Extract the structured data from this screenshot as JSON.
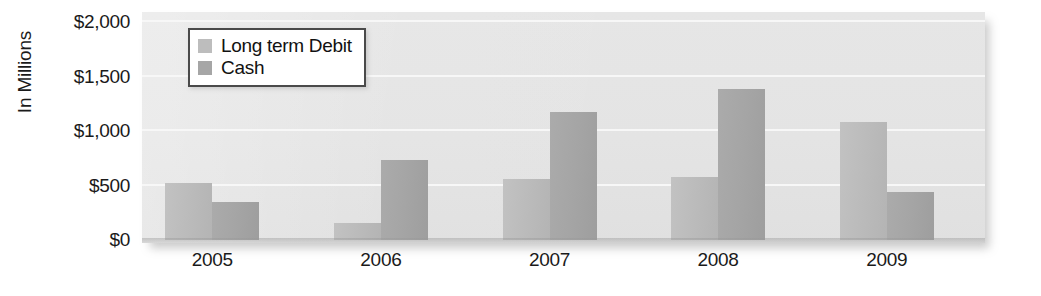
{
  "chart_data": {
    "type": "bar",
    "title": "",
    "subtitle": "",
    "xlabel": "",
    "ylabel": "In Millions",
    "categories": [
      "2005",
      "2006",
      "2007",
      "2008",
      "2009"
    ],
    "series": [
      {
        "name": "Long term Debit",
        "color": "#bdbdbd",
        "values": [
          520,
          160,
          560,
          580,
          1080
        ]
      },
      {
        "name": "Cash",
        "color": "#a6a6a6",
        "values": [
          350,
          730,
          1170,
          1390,
          440
        ]
      }
    ],
    "ylim": [
      0,
      2000
    ],
    "yticks": [
      0,
      500,
      1000,
      1500,
      2000
    ],
    "ytick_labels": [
      "$0",
      "$500",
      "$1,000",
      "$1,500",
      "$2,000"
    ],
    "grid": true,
    "grid_color": "#f7f7f7",
    "legend_position": "top-left",
    "plot_background": "#e4e4e4"
  },
  "legend": {
    "items": [
      {
        "label": "Long term Debit",
        "swatch": "#bdbdbd"
      },
      {
        "label": "Cash",
        "swatch": "#a6a6a6"
      }
    ]
  },
  "axis": {
    "y_title": "In Millions",
    "y_labels": [
      "$2,000",
      "$1,500",
      "$1,000",
      "$500",
      "$0"
    ],
    "x_labels": [
      "2005",
      "2006",
      "2007",
      "2008",
      "2009"
    ]
  }
}
